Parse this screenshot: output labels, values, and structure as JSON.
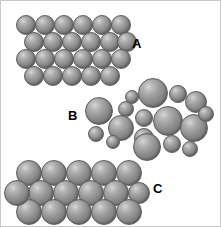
{
  "figure": {
    "width": 221,
    "height": 227,
    "background_color": "#ffffff",
    "border_color": "#c9c9c9",
    "sphere_fill_light": "#d8d8d8",
    "sphere_fill_mid": "#8e8e8e",
    "sphere_fill_dark": "#636363",
    "sphere_outline": "#5d5d5d",
    "label_color": "#000000"
  },
  "labels": [
    {
      "id": "label-a",
      "text": "A",
      "x": 131,
      "y": 36,
      "size": 13
    },
    {
      "id": "label-b",
      "text": "B",
      "x": 67,
      "y": 108,
      "size": 13
    },
    {
      "id": "label-c",
      "text": "C",
      "x": 152,
      "y": 181,
      "size": 13
    }
  ],
  "clusters": [
    {
      "id": "cluster-a",
      "label": "A",
      "description": "ordered close-packed lattice of small uniform spheres",
      "sphere_count": 23,
      "rows": 4,
      "spheres": [
        {
          "cx": 25,
          "cy": 24,
          "r": 10
        },
        {
          "cx": 44,
          "cy": 24,
          "r": 10
        },
        {
          "cx": 63,
          "cy": 24,
          "r": 10
        },
        {
          "cx": 82,
          "cy": 24,
          "r": 10
        },
        {
          "cx": 101,
          "cy": 24,
          "r": 10
        },
        {
          "cx": 120,
          "cy": 24,
          "r": 10
        },
        {
          "cx": 33,
          "cy": 41,
          "r": 10
        },
        {
          "cx": 52,
          "cy": 41,
          "r": 10
        },
        {
          "cx": 71,
          "cy": 41,
          "r": 10
        },
        {
          "cx": 90,
          "cy": 41,
          "r": 10
        },
        {
          "cx": 109,
          "cy": 41,
          "r": 10
        },
        {
          "cx": 126,
          "cy": 41,
          "r": 10
        },
        {
          "cx": 25,
          "cy": 58,
          "r": 10
        },
        {
          "cx": 44,
          "cy": 58,
          "r": 10
        },
        {
          "cx": 63,
          "cy": 58,
          "r": 10
        },
        {
          "cx": 82,
          "cy": 58,
          "r": 10
        },
        {
          "cx": 101,
          "cy": 58,
          "r": 10
        },
        {
          "cx": 120,
          "cy": 58,
          "r": 10
        },
        {
          "cx": 33,
          "cy": 75,
          "r": 10
        },
        {
          "cx": 52,
          "cy": 75,
          "r": 10
        },
        {
          "cx": 71,
          "cy": 75,
          "r": 10
        },
        {
          "cx": 90,
          "cy": 75,
          "r": 10
        },
        {
          "cx": 109,
          "cy": 75,
          "r": 10
        }
      ]
    },
    {
      "id": "cluster-b",
      "label": "B",
      "description": "disordered amorphous packing of mixed-size spheres",
      "sphere_count": 17,
      "rows": 0,
      "spheres": [
        {
          "cx": 152,
          "cy": 92,
          "r": 15
        },
        {
          "cx": 177,
          "cy": 93,
          "r": 9
        },
        {
          "cx": 195,
          "cy": 101,
          "r": 11
        },
        {
          "cx": 98,
          "cy": 110,
          "r": 14
        },
        {
          "cx": 125,
          "cy": 108,
          "r": 8
        },
        {
          "cx": 143,
          "cy": 117,
          "r": 9
        },
        {
          "cx": 167,
          "cy": 120,
          "r": 15
        },
        {
          "cx": 193,
          "cy": 127,
          "r": 14
        },
        {
          "cx": 120,
          "cy": 127,
          "r": 13
        },
        {
          "cx": 95,
          "cy": 133,
          "r": 8
        },
        {
          "cx": 143,
          "cy": 137,
          "r": 10
        },
        {
          "cx": 146,
          "cy": 146,
          "r": 14
        },
        {
          "cx": 171,
          "cy": 143,
          "r": 9
        },
        {
          "cx": 189,
          "cy": 148,
          "r": 8
        },
        {
          "cx": 112,
          "cy": 141,
          "r": 7
        },
        {
          "cx": 205,
          "cy": 113,
          "r": 8
        },
        {
          "cx": 131,
          "cy": 96,
          "r": 7
        }
      ]
    },
    {
      "id": "cluster-c",
      "label": "C",
      "description": "ordered close-packed lattice of large uniform spheres",
      "sphere_count": 16,
      "rows": 3,
      "spheres": [
        {
          "cx": 28,
          "cy": 172,
          "r": 13
        },
        {
          "cx": 53,
          "cy": 172,
          "r": 13
        },
        {
          "cx": 78,
          "cy": 172,
          "r": 13
        },
        {
          "cx": 103,
          "cy": 172,
          "r": 13
        },
        {
          "cx": 128,
          "cy": 172,
          "r": 13
        },
        {
          "cx": 40,
          "cy": 192,
          "r": 13
        },
        {
          "cx": 65,
          "cy": 192,
          "r": 13
        },
        {
          "cx": 90,
          "cy": 192,
          "r": 13
        },
        {
          "cx": 115,
          "cy": 192,
          "r": 13
        },
        {
          "cx": 138,
          "cy": 192,
          "r": 11
        },
        {
          "cx": 28,
          "cy": 211,
          "r": 13
        },
        {
          "cx": 53,
          "cy": 211,
          "r": 13
        },
        {
          "cx": 78,
          "cy": 211,
          "r": 13
        },
        {
          "cx": 103,
          "cy": 211,
          "r": 13
        },
        {
          "cx": 128,
          "cy": 211,
          "r": 13
        },
        {
          "cx": 16,
          "cy": 192,
          "r": 13
        }
      ]
    }
  ]
}
